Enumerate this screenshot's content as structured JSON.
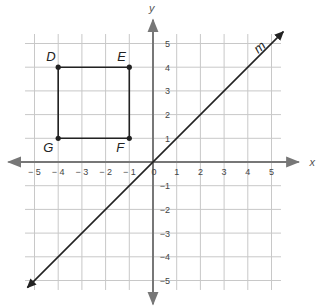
{
  "diagram": {
    "type": "coordinate-plane",
    "x_axis_label": "x",
    "y_axis_label": "y",
    "x_ticks": [
      "-5",
      "-4",
      "-3",
      "-2",
      "-1",
      "1",
      "2",
      "3",
      "4",
      "5"
    ],
    "y_ticks": [
      "5",
      "4",
      "3",
      "2",
      "1",
      "-1",
      "-2",
      "-3",
      "-4",
      "-5"
    ],
    "origin_label": "0",
    "points": [
      {
        "label": "D",
        "x": -4,
        "y": 4
      },
      {
        "label": "E",
        "x": -1,
        "y": 4
      },
      {
        "label": "F",
        "x": -1,
        "y": 1
      },
      {
        "label": "G",
        "x": -4,
        "y": 1
      }
    ],
    "line": {
      "label": "m",
      "equation": "y = x"
    },
    "colors": {
      "grid": "#c8c8c8",
      "axis": "#777777",
      "shape": "#222222"
    }
  }
}
